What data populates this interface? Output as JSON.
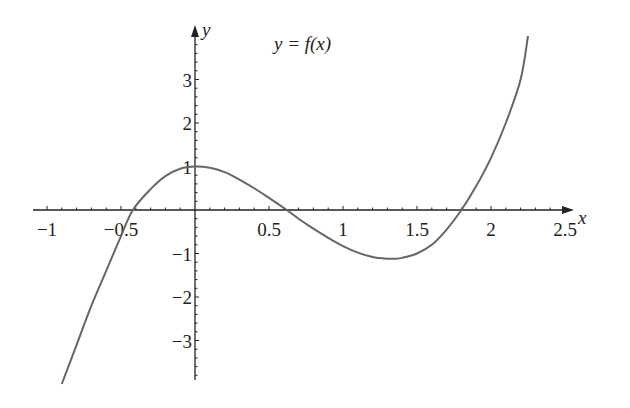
{
  "chart_data": {
    "type": "line",
    "title": "y = f(x)",
    "xlabel": "x",
    "ylabel": "y",
    "xlim": [
      -1.1,
      2.6
    ],
    "ylim": [
      -4.0,
      4.1
    ],
    "x_ticks": [
      -1,
      -0.5,
      0.5,
      1,
      1.5,
      2,
      2.5
    ],
    "x_tick_labels": [
      "−1",
      "−0.5",
      "0.5",
      "1",
      "1.5",
      "2",
      "2.5"
    ],
    "y_ticks": [
      -3,
      -2,
      -1,
      1,
      2,
      3
    ],
    "y_tick_labels": [
      "−3",
      "−2",
      "−1",
      "1",
      "2",
      "3"
    ],
    "grid": false,
    "legend": null,
    "annotations": [
      {
        "text": "y = f(x)",
        "x": 0.95,
        "y": 3.5
      }
    ],
    "series": [
      {
        "name": "f(x)",
        "description": "Cubic with local max 1 at x=0, local min about -1.1 near x=1.35, roots near -0.42, 0.62, 1.8",
        "x": [
          -0.9,
          -0.8,
          -0.7,
          -0.6,
          -0.5,
          -0.42,
          -0.3,
          -0.2,
          -0.1,
          0,
          0.1,
          0.2,
          0.3,
          0.4,
          0.5,
          0.62,
          0.7,
          0.8,
          0.9,
          1.0,
          1.1,
          1.2,
          1.3,
          1.35,
          1.4,
          1.5,
          1.6,
          1.7,
          1.8,
          1.9,
          2.0,
          2.1,
          2.2,
          2.25
        ],
        "y": [
          -4.0,
          -3.1,
          -2.2,
          -1.4,
          -0.6,
          0.0,
          0.48,
          0.78,
          0.95,
          1.0,
          0.97,
          0.87,
          0.7,
          0.5,
          0.28,
          0.0,
          -0.2,
          -0.43,
          -0.64,
          -0.83,
          -0.98,
          -1.08,
          -1.12,
          -1.12,
          -1.1,
          -1.0,
          -0.8,
          -0.45,
          0.0,
          0.55,
          1.2,
          2.0,
          3.0,
          4.0
        ]
      }
    ]
  },
  "labels": {
    "title": "y = f(x)",
    "x_axis": "x",
    "y_axis": "y"
  },
  "colors": {
    "axis": "#222222",
    "curve": "#666666"
  }
}
